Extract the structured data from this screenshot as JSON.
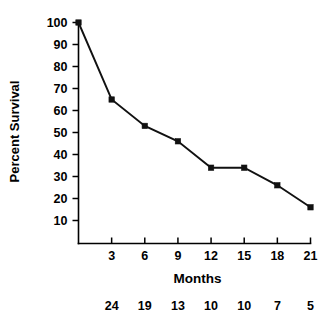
{
  "chart_data": {
    "type": "line",
    "title": "",
    "subtitle": "",
    "xlabel": "Months",
    "ylabel": "Percent Survival",
    "x": [
      0,
      3,
      6,
      9,
      12,
      15,
      18,
      21
    ],
    "values": [
      100,
      65,
      53,
      46,
      34,
      34,
      26,
      16
    ],
    "series": [
      {
        "name": "Percent Survival",
        "x": [
          0,
          3,
          6,
          9,
          12,
          15,
          18,
          21
        ],
        "values": [
          100,
          65,
          53,
          46,
          34,
          34,
          26,
          16
        ]
      }
    ],
    "xlim": [
      0,
      21
    ],
    "ylim": [
      0,
      100
    ],
    "xticks": [
      3,
      6,
      9,
      12,
      15,
      18,
      21
    ],
    "xtick_labels": [
      "3",
      "6",
      "9",
      "12",
      "15",
      "18",
      "21"
    ],
    "yticks": [
      10,
      20,
      30,
      40,
      50,
      60,
      70,
      80,
      90,
      100
    ],
    "ytick_labels": [
      "10",
      "20",
      "30",
      "40",
      "50",
      "60",
      "70",
      "80",
      "90",
      "100"
    ],
    "grid": false,
    "legend": false,
    "legend_position": "none",
    "marker": "filled-square",
    "line_color": "#111111",
    "axis_color": "#000000",
    "background_color": "#ffffff",
    "at_risk": {
      "x": [
        3,
        6,
        9,
        12,
        15,
        18,
        21
      ],
      "counts": [
        "24",
        "19",
        "13",
        "10",
        "10",
        "7",
        "5"
      ]
    }
  }
}
